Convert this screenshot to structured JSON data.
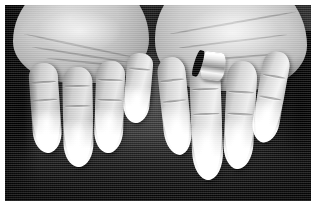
{
  "image": {
    "kind": "clinical-photograph",
    "subject": "Both hands, palms facing upward, resting on a dark cloth background",
    "caption": "Pallor of the fingertips of both hands",
    "finding": "Raynaud phenomenon - blanching (white phase) of the distal fingers",
    "color_mode": "grayscale",
    "border_color": "#ffffff",
    "background_color": "#242424",
    "skin_color": "#b9b2ad",
    "blanched_tip_color": "#fbfaf8",
    "ring_metal_color": "#e2ded6"
  },
  "hands": [
    {
      "side": "left",
      "label": "Left hand",
      "orientation": "palm up",
      "fingers": [
        {
          "name": "index",
          "label": "Left index finger",
          "tip": "pale"
        },
        {
          "name": "middle",
          "label": "Left middle finger",
          "tip": "pale"
        },
        {
          "name": "ring",
          "label": "Left ring finger",
          "tip": "pale"
        },
        {
          "name": "little",
          "label": "Left little finger",
          "tip": "pale"
        }
      ],
      "jewellery": []
    },
    {
      "side": "right",
      "label": "Right hand",
      "orientation": "palm up",
      "fingers": [
        {
          "name": "index",
          "label": "Right index finger",
          "tip": "pale"
        },
        {
          "name": "middle",
          "label": "Right middle finger",
          "tip": "pale"
        },
        {
          "name": "ring",
          "label": "Right ring finger",
          "tip": "pale"
        },
        {
          "name": "little",
          "label": "Right little finger",
          "tip": "pale"
        }
      ],
      "jewellery": [
        {
          "type": "ring",
          "label": "Ring on right ring finger",
          "worn_on": "ring finger"
        }
      ]
    }
  ]
}
